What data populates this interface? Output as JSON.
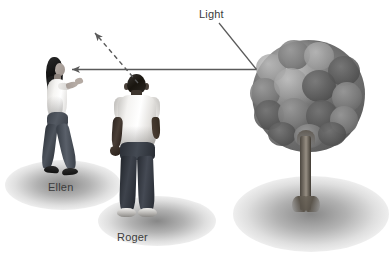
{
  "diagram": {
    "title_text": "Light",
    "background_color": "#ffffff",
    "line_color": "#5a5a5a",
    "text_color": "#3c3c3c",
    "labels": {
      "light": "Light",
      "ellen": "Ellen",
      "roger": "Roger"
    },
    "figures": {
      "ellen": {
        "name": "Ellen",
        "description": "woman walking left, white top, dark jeans, long dark hair, arm raised pointing"
      },
      "roger": {
        "name": "Roger",
        "description": "man seen from behind, white t-shirt, dark jeans, white sneakers"
      },
      "tree": {
        "name": "tree",
        "description": "broadleaf tree with round canopy and gray trunk"
      }
    },
    "rays": [
      {
        "name": "incident-ray-from-tree-to-ellen",
        "style": "solid",
        "from": "tree",
        "to": "Ellen",
        "arrowhead": "at Ellen"
      },
      {
        "name": "reflected-ray-past-roger",
        "style": "dashed",
        "from": "near Roger",
        "to": "upper left",
        "arrowhead": "upper left"
      },
      {
        "name": "light-label-leader-line",
        "style": "solid",
        "from": "Light label",
        "to": "ray junction"
      }
    ],
    "shadows": [
      {
        "name": "ellen-shadow"
      },
      {
        "name": "roger-shadow"
      },
      {
        "name": "tree-shadow"
      }
    ]
  }
}
